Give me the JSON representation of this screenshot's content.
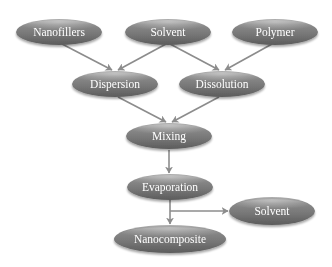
{
  "diagram": {
    "type": "flowchart",
    "title": "",
    "colors": {
      "node_fill": "#787878",
      "node_highlight": "#a8a8a8",
      "node_shadow": "#5a5a5a",
      "node_text": "#ffffff",
      "arrow": "#8c8c8c",
      "background": "#ffffff"
    },
    "nodes": [
      {
        "id": "nanofillers",
        "label": "Nanofillers",
        "cx": 59,
        "cy": 32,
        "rx": 43,
        "ry": 13
      },
      {
        "id": "solvent_in",
        "label": "Solvent",
        "cx": 168,
        "cy": 32,
        "rx": 43,
        "ry": 13
      },
      {
        "id": "polymer",
        "label": "Polymer",
        "cx": 275,
        "cy": 32,
        "rx": 43,
        "ry": 13
      },
      {
        "id": "dispersion",
        "label": "Dispersion",
        "cx": 115,
        "cy": 84,
        "rx": 43,
        "ry": 13
      },
      {
        "id": "dissolution",
        "label": "Dissolution",
        "cx": 222,
        "cy": 84,
        "rx": 43,
        "ry": 13
      },
      {
        "id": "mixing",
        "label": "Mixing",
        "cx": 169,
        "cy": 136,
        "rx": 43,
        "ry": 13
      },
      {
        "id": "evaporation",
        "label": "Evaporation",
        "cx": 170,
        "cy": 187,
        "rx": 43,
        "ry": 13
      },
      {
        "id": "solvent_out",
        "label": "Solvent",
        "cx": 272,
        "cy": 211,
        "rx": 43,
        "ry": 14
      },
      {
        "id": "nanocomposite",
        "label": "Nanocomposite",
        "cx": 170,
        "cy": 239,
        "rx": 56,
        "ry": 14
      }
    ],
    "edges": [
      {
        "from": "nanofillers",
        "to": "dispersion"
      },
      {
        "from": "solvent_in",
        "to": "dispersion"
      },
      {
        "from": "solvent_in",
        "to": "dissolution"
      },
      {
        "from": "polymer",
        "to": "dissolution"
      },
      {
        "from": "dispersion",
        "to": "mixing"
      },
      {
        "from": "dissolution",
        "to": "mixing"
      },
      {
        "from": "mixing",
        "to": "evaporation"
      },
      {
        "from": "evaporation",
        "to": "nanocomposite"
      },
      {
        "from": "evaporation",
        "to": "solvent_out"
      }
    ]
  },
  "labels": {
    "nanofillers": "Nanofillers",
    "solvent_in": "Solvent",
    "polymer": "Polymer",
    "dispersion": "Dispersion",
    "dissolution": "Dissolution",
    "mixing": "Mixing",
    "evaporation": "Evaporation",
    "solvent_out": "Solvent",
    "nanocomposite": "Nanocomposite"
  }
}
